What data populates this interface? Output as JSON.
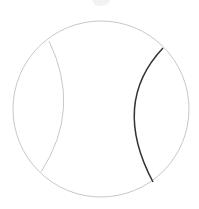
{
  "diagram": {
    "type": "sphere-with-arcs",
    "colors": {
      "outline": "#c8c8c8",
      "left_arc": "#c8c8c8",
      "right_arc": "#333333",
      "top_marker": "#f0f0f0"
    },
    "circle": {
      "cx": 101,
      "cy": 109,
      "r": 88
    },
    "left_arc": {
      "start": [
        49,
        41
      ],
      "control": [
        82,
        109
      ],
      "end": [
        41,
        172
      ]
    },
    "right_arc": {
      "start": [
        163,
        48
      ],
      "control": [
        111,
        103
      ],
      "end": [
        153,
        182
      ]
    }
  }
}
